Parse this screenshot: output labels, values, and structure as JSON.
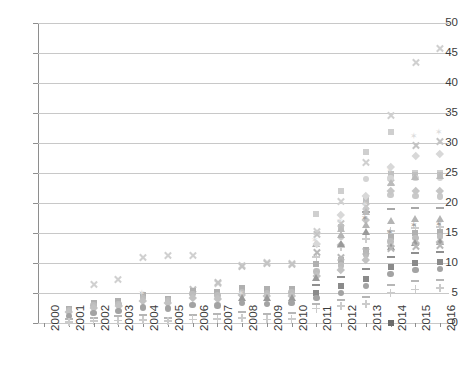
{
  "chart_data": {
    "type": "scatter",
    "title": "",
    "subtitle": "",
    "xlabel": "",
    "ylabel": "",
    "xlim": [
      2000,
      2016
    ],
    "ylim": [
      0,
      50
    ],
    "grid": true,
    "legend": "none",
    "y_ticks": [
      0,
      5,
      10,
      15,
      20,
      25,
      30,
      35,
      40,
      45,
      50
    ],
    "x_ticks": [
      "2000",
      "2001",
      "2002",
      "2003",
      "2004",
      "2005",
      "2006",
      "2007",
      "2008",
      "2009",
      "2010",
      "2011",
      "2012",
      "2013",
      "2014",
      "2015",
      "2016"
    ],
    "categories": [
      "2000",
      "2001",
      "2002",
      "2003",
      "2004",
      "2005",
      "2006",
      "2007",
      "2008",
      "2009",
      "2010",
      "2011",
      "2012",
      "2013",
      "2014",
      "2015",
      "2016"
    ],
    "marker_colors": {
      "light": "#d9d9d9",
      "mid": "#bfbfbf",
      "dark": "#8c8c8c",
      "darker": "#6e6e6e",
      "faint": "#ececec"
    },
    "series": [
      {
        "name": "S01",
        "marker": "x",
        "color": "#d0d0d0",
        "x": [
          "2002",
          "2003",
          "2004",
          "2005",
          "2006",
          "2007",
          "2008",
          "2009",
          "2010",
          "2011",
          "2012",
          "2013",
          "2014",
          "2015",
          "2016"
        ],
        "values": [
          6.5,
          7.2,
          11.0,
          11.3,
          11.2,
          6.6,
          9.6,
          10.1,
          10.0,
          15.2,
          20.2,
          26.8,
          34.6,
          43.5,
          45.8
        ]
      },
      {
        "name": "S02",
        "marker": "x",
        "color": "#c4c4c4",
        "x": [
          "2006",
          "2007",
          "2008",
          "2009",
          "2010",
          "2011",
          "2012",
          "2013",
          "2014",
          "2015",
          "2016"
        ],
        "values": [
          5.6,
          6.7,
          9.4,
          9.9,
          9.8,
          14.8,
          16.6,
          19.4,
          23.5,
          29.6,
          30.2
        ]
      },
      {
        "name": "S03",
        "marker": "square",
        "color": "#cfcfcf",
        "x": [
          "2011",
          "2012",
          "2013",
          "2014",
          "2015",
          "2016"
        ],
        "values": [
          18.2,
          22.0,
          28.5,
          31.9,
          25.0,
          25.0
        ]
      },
      {
        "name": "S04",
        "marker": "square",
        "color": "#c0c0c0",
        "x": [
          "2012",
          "2013",
          "2014",
          "2015",
          "2016"
        ],
        "values": [
          16.0,
          20.5,
          24.8,
          24.6,
          24.6
        ]
      },
      {
        "name": "S05",
        "marker": "circle",
        "color": "#c9c9c9",
        "x": [
          "2012",
          "2013",
          "2014",
          "2015",
          "2016"
        ],
        "values": [
          14.3,
          19.0,
          21.3,
          21.2,
          21.1
        ]
      },
      {
        "name": "S06",
        "marker": "circle",
        "color": "#d4d4d4",
        "x": [
          "2013",
          "2014",
          "2015",
          "2016"
        ],
        "values": [
          24.0,
          24.2,
          24.2,
          24.2
        ]
      },
      {
        "name": "S07",
        "marker": "diamond",
        "color": "#c6c6c6",
        "x": [
          "2012",
          "2013",
          "2014",
          "2015",
          "2016"
        ],
        "values": [
          13.0,
          17.2,
          22.1,
          22.0,
          22.0
        ]
      },
      {
        "name": "S08",
        "marker": "triangle",
        "color": "#b4b4b4",
        "x": [
          "2011",
          "2012",
          "2013",
          "2014",
          "2015",
          "2016"
        ],
        "values": [
          12.8,
          14.4,
          16.0,
          16.6,
          17.0,
          17.0
        ]
      },
      {
        "name": "S09",
        "marker": "dash",
        "color": "#a8a8a8",
        "x": [
          "2013",
          "2014",
          "2015",
          "2016"
        ],
        "values": [
          18.5,
          19.0,
          19.2,
          19.2
        ]
      },
      {
        "name": "S10",
        "marker": "plus",
        "color": "#cdcdcd",
        "x": [
          "2011",
          "2012",
          "2013",
          "2014",
          "2015",
          "2016"
        ],
        "values": [
          11.0,
          12.6,
          14.0,
          15.3,
          15.8,
          16.0
        ]
      },
      {
        "name": "S11",
        "marker": "star",
        "color": "#9f9f9f",
        "x": [
          "2013",
          "2014",
          "2015",
          "2016"
        ],
        "values": [
          17.4,
          15.0,
          16.2,
          16.4
        ]
      },
      {
        "name": "S12",
        "marker": "square",
        "color": "#b0b0b0",
        "x": [
          "2001",
          "2002",
          "2003",
          "2004",
          "2005",
          "2006",
          "2007",
          "2008",
          "2009",
          "2010",
          "2011",
          "2012",
          "2013",
          "2014",
          "2015",
          "2016"
        ],
        "values": [
          2.4,
          3.3,
          3.6,
          4.6,
          4.0,
          5.3,
          5.2,
          5.8,
          5.6,
          5.7,
          9.8,
          10.5,
          12.2,
          14.4,
          15.0,
          15.2
        ]
      },
      {
        "name": "S13",
        "marker": "circle",
        "color": "#bdbdbd",
        "x": [
          "2001",
          "2002",
          "2003",
          "2004",
          "2005",
          "2006",
          "2007",
          "2008",
          "2009",
          "2010",
          "2011",
          "2012",
          "2013",
          "2014",
          "2015",
          "2016"
        ],
        "values": [
          2.1,
          2.9,
          3.2,
          4.2,
          3.8,
          4.8,
          4.6,
          5.2,
          5.0,
          5.1,
          8.6,
          9.6,
          11.4,
          13.6,
          14.2,
          14.4
        ]
      },
      {
        "name": "S14",
        "marker": "diamond",
        "color": "#c2c2c2",
        "x": [
          "2001",
          "2002",
          "2003",
          "2004",
          "2005",
          "2006",
          "2007",
          "2008",
          "2009",
          "2010",
          "2011",
          "2012",
          "2013",
          "2014",
          "2015",
          "2016"
        ],
        "values": [
          1.8,
          2.5,
          2.8,
          3.7,
          3.4,
          4.2,
          4.1,
          4.7,
          4.5,
          4.6,
          7.9,
          8.8,
          10.6,
          12.8,
          13.4,
          13.6
        ]
      },
      {
        "name": "S15",
        "marker": "triangle",
        "color": "#9a9a9a",
        "x": [
          "2008",
          "2009",
          "2010",
          "2011",
          "2012",
          "2013",
          "2014",
          "2015",
          "2016"
        ],
        "values": [
          3.9,
          3.8,
          3.9,
          7.2,
          12.8,
          14.8,
          12.4,
          13.0,
          13.2
        ]
      },
      {
        "name": "S16",
        "marker": "x",
        "color": "#b8b8b8",
        "x": [
          "2011",
          "2012",
          "2013",
          "2014",
          "2015",
          "2016"
        ],
        "values": [
          11.8,
          11.0,
          12.0,
          12.5,
          12.8,
          12.9
        ]
      },
      {
        "name": "S17",
        "marker": "dash",
        "color": "#8f8f8f",
        "x": [
          "2011",
          "2012",
          "2013",
          "2014",
          "2015",
          "2016"
        ],
        "values": [
          6.4,
          7.6,
          9.0,
          11.0,
          11.6,
          11.8
        ]
      },
      {
        "name": "S18",
        "marker": "square",
        "color": "#8a8a8a",
        "x": [
          "2011",
          "2012",
          "2013",
          "2014",
          "2015",
          "2016"
        ],
        "values": [
          5.0,
          6.2,
          7.4,
          9.4,
          10.0,
          10.2
        ]
      },
      {
        "name": "S19",
        "marker": "circle",
        "color": "#a3a3a3",
        "x": [
          "2001",
          "2002",
          "2003",
          "2004",
          "2005",
          "2006",
          "2007",
          "2008",
          "2009",
          "2010",
          "2011",
          "2012",
          "2013",
          "2014",
          "2015",
          "2016"
        ],
        "values": [
          1.2,
          1.7,
          2.0,
          2.6,
          2.4,
          3.0,
          2.9,
          3.3,
          3.2,
          3.3,
          4.2,
          5.0,
          6.2,
          8.2,
          8.8,
          9.0
        ]
      },
      {
        "name": "S20",
        "marker": "square",
        "color": "#6b6b6b",
        "x": [
          "2014"
        ],
        "values": [
          0.0
        ]
      },
      {
        "name": "S21",
        "marker": "dash",
        "color": "#b6b6b6",
        "x": [
          "2001",
          "2002",
          "2003",
          "2004",
          "2005",
          "2006",
          "2007",
          "2008",
          "2009",
          "2010",
          "2011",
          "2012",
          "2013",
          "2014",
          "2015",
          "2016"
        ],
        "values": [
          0.6,
          0.9,
          1.1,
          1.4,
          0.9,
          1.3,
          1.5,
          1.8,
          1.5,
          1.6,
          3.2,
          3.8,
          4.4,
          6.4,
          7.0,
          7.2
        ]
      },
      {
        "name": "S22",
        "marker": "plus",
        "color": "#cbcbcb",
        "x": [
          "2001",
          "2002",
          "2003",
          "2004",
          "2005",
          "2006",
          "2007",
          "2008",
          "2009",
          "2010",
          "2011",
          "2012",
          "2013",
          "2014",
          "2015",
          "2016"
        ],
        "values": [
          0.2,
          0.3,
          0.4,
          0.5,
          0.3,
          0.6,
          0.7,
          0.8,
          0.6,
          0.7,
          2.4,
          2.8,
          3.2,
          5.0,
          5.6,
          5.8
        ]
      },
      {
        "name": "S23",
        "marker": "star",
        "color": "#dcdcdc",
        "x": [
          "2004",
          "2008",
          "2011",
          "2012",
          "2013",
          "2014",
          "2015",
          "2016"
        ],
        "values": [
          4.8,
          4.9,
          13.6,
          16.8,
          19.6,
          25.4,
          31.0,
          31.6
        ]
      },
      {
        "name": "S24",
        "marker": "diamond",
        "color": "#d8d8d8",
        "x": [
          "2011",
          "2012",
          "2013",
          "2014",
          "2015",
          "2016"
        ],
        "values": [
          13.2,
          18.0,
          21.2,
          26.0,
          27.8,
          28.2
        ]
      },
      {
        "name": "S25",
        "marker": "triangle",
        "color": "#bbbbbb",
        "x": [
          "2012",
          "2013",
          "2014",
          "2015",
          "2016"
        ],
        "values": [
          15.4,
          18.2,
          23.0,
          24.0,
          24.2
        ]
      }
    ]
  }
}
